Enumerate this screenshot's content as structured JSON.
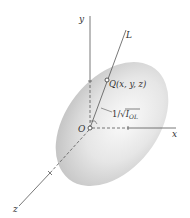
{
  "diagram": {
    "labels": {
      "y_axis": "y",
      "x_axis": "x",
      "z_axis": "z",
      "line": "L",
      "origin": "O",
      "point": "Q(x, y, z)",
      "distance_prefix": "1/√",
      "distance_var": "I",
      "distance_sub": "OL"
    },
    "colors": {
      "axis": "#555555",
      "ellipsoid_light": "#f7f7f7",
      "ellipsoid_dark": "#c9c9c9",
      "text": "#333333"
    }
  }
}
